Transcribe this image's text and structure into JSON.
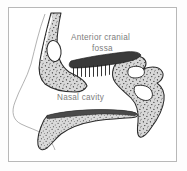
{
  "figure": {
    "kind": "anatomical-sagittal-section",
    "frame": {
      "border_color": "#b8b8b8",
      "background_color": "#ffffff",
      "outer_background": "#fdfdfd"
    }
  },
  "labels": {
    "anterior_cranial_fossa_line1": "Anterior cranial",
    "anterior_cranial_fossa_line2": "fossa",
    "nasal_cavity": "Nasal cavity",
    "text_color": "#7c7c7c"
  },
  "structures": {
    "frontal_bone": {
      "name": "frontal bone with frontal sinus",
      "fill": "#d6d6d6",
      "outline": "#2b2b2b",
      "sinus_fill": "#ffffff"
    },
    "cribriform_plate": {
      "name": "cribriform plate",
      "fill": "#3a3a3a",
      "filament_count": 10,
      "filament_color": "#1e1e1e"
    },
    "sphenoid_region": {
      "name": "sphenoid and posterior nasal wall",
      "fill": "#d6d6d6",
      "outline": "#2b2b2b"
    },
    "inferior_turbinate": {
      "name": "inferior turbinate",
      "fill": "#d6d6d6",
      "outline": "#2b2b2b",
      "crest_color": "#4a4a4a"
    },
    "nose_profile": {
      "name": "external nose soft tissue profile",
      "stroke": "#a9a9a9"
    },
    "stipple": {
      "name": "cancellous bone stipple",
      "dot_color": "#1c1c1c"
    }
  }
}
